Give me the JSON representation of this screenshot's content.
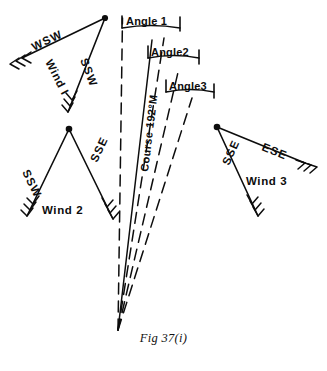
{
  "figure": {
    "caption": "Fig 37(i)",
    "course_label": "Course 192°M",
    "ink_color": "#0d0d0d",
    "background_color": "#ffffff"
  },
  "angles": [
    {
      "label": "Angle 1"
    },
    {
      "label": "Angle2"
    },
    {
      "label": "Angle3"
    }
  ],
  "wind_triangles": [
    {
      "name": "Wind 1",
      "vertex_label": "Wind I",
      "arrows": [
        {
          "direction_label": "WSW"
        },
        {
          "direction_label": "SSW"
        }
      ]
    },
    {
      "name": "Wind 2",
      "vertex_label": "Wind 2",
      "arrows": [
        {
          "direction_label": "SSW"
        },
        {
          "direction_label": "SSE"
        }
      ]
    },
    {
      "name": "Wind 3",
      "vertex_label": "Wind 3",
      "arrows": [
        {
          "direction_label": "ESE"
        },
        {
          "direction_label": "SSE"
        }
      ]
    }
  ]
}
